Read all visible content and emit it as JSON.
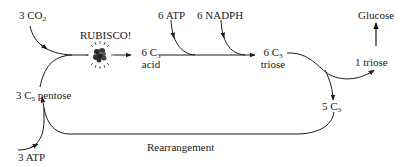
{
  "diagram": {
    "inputs": {
      "co2": {
        "count": "3",
        "species": "CO",
        "sub": "2"
      },
      "atp_top": "6 ATP",
      "nadph": "6 NADPH",
      "atp_bottom": "3 ATP"
    },
    "enzyme": {
      "label": "RUBISCO!",
      "icon": "rubisco-molecule-icon"
    },
    "nodes": {
      "acid": {
        "count": "6 C",
        "sub": "3",
        "name": "acid"
      },
      "triose": {
        "count": "6 C",
        "sub": "3",
        "name": "triose"
      },
      "one_triose": "1 triose",
      "glucose": "Glucose",
      "five_c3": {
        "count": "5 C",
        "sub": "3"
      },
      "pentose": {
        "count": "3 C",
        "sub": "5",
        "name": "pentose"
      }
    },
    "edges_label": {
      "rearrangement": "Rearrangement"
    },
    "colors": {
      "line": "#1a1a1a",
      "background": "#ffffff"
    }
  }
}
